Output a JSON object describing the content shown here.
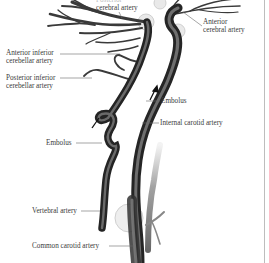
{
  "figure": {
    "colors": {
      "artery_dark": "#2e2e2e",
      "artery_mid": "#5a5a5a",
      "artery_light": "#9a9a9a",
      "halo": "#d8d8d8",
      "label_text": "#3a3a3a",
      "leader_line": "#6a6a6a",
      "right_border": "#bdbdbd"
    },
    "labels": [
      {
        "id": "posterior-cerebral",
        "lines": [
          "Posterior",
          "cerebral artery"
        ]
      },
      {
        "id": "anterior-cerebral",
        "lines": [
          "Anterior",
          "cerebral artery"
        ]
      },
      {
        "id": "anterior-inferior-cerebellar",
        "lines": [
          "Anterior inferior",
          "cerebellar artery"
        ]
      },
      {
        "id": "posterior-inferior-cerebellar",
        "lines": [
          "Posterior inferior",
          "cerebellar artery"
        ]
      },
      {
        "id": "embolus-upper",
        "lines": [
          "Embolus"
        ]
      },
      {
        "id": "internal-carotid",
        "lines": [
          "Internal carotid artery"
        ]
      },
      {
        "id": "embolus-lower",
        "lines": [
          "Embolus"
        ]
      },
      {
        "id": "vertebral",
        "lines": [
          "Vertebral artery"
        ]
      },
      {
        "id": "common-carotid",
        "lines": [
          "Common carotid artery"
        ]
      }
    ]
  }
}
